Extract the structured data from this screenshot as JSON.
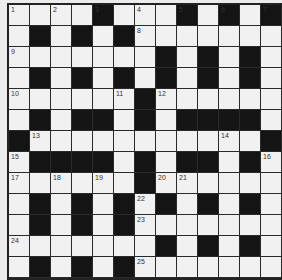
{
  "puzzle": {
    "type": "crossword",
    "rows": 13,
    "cols": 13,
    "colors": {
      "white_cell": "#f1f1f1",
      "black_cell": "#141414",
      "background": "#ececec",
      "grid_line": "#2a2a2a"
    },
    "layout": [
      "....#...#.#.#",
      ".#.#.#.......",
      ".......#.#.#.",
      ".#.#.#.#.#.#.",
      "......#......",
      ".#.##.#.####.",
      "#...........#",
      ".####.#.##.#.",
      "......#......",
      ".#.#.#.#.#.#.",
      ".#.#.#.......",
      ".......#.#.#.",
      ".#.#.#......."
    ],
    "numbers": [
      {
        "row": 0,
        "col": 0,
        "n": "1"
      },
      {
        "row": 0,
        "col": 2,
        "n": "2"
      },
      {
        "row": 0,
        "col": 4,
        "n": "3"
      },
      {
        "row": 0,
        "col": 6,
        "n": "4"
      },
      {
        "row": 0,
        "col": 8,
        "n": "5"
      },
      {
        "row": 0,
        "col": 10,
        "n": "6"
      },
      {
        "row": 0,
        "col": 12,
        "n": "7"
      },
      {
        "row": 1,
        "col": 6,
        "n": "8"
      },
      {
        "row": 2,
        "col": 0,
        "n": "9"
      },
      {
        "row": 4,
        "col": 0,
        "n": "10"
      },
      {
        "row": 4,
        "col": 5,
        "n": "11"
      },
      {
        "row": 4,
        "col": 7,
        "n": "12"
      },
      {
        "row": 6,
        "col": 1,
        "n": "13"
      },
      {
        "row": 6,
        "col": 10,
        "n": "14"
      },
      {
        "row": 7,
        "col": 0,
        "n": "15"
      },
      {
        "row": 7,
        "col": 12,
        "n": "16"
      },
      {
        "row": 8,
        "col": 0,
        "n": "17"
      },
      {
        "row": 8,
        "col": 2,
        "n": "18"
      },
      {
        "row": 8,
        "col": 4,
        "n": "19"
      },
      {
        "row": 8,
        "col": 7,
        "n": "20"
      },
      {
        "row": 8,
        "col": 8,
        "n": "21"
      },
      {
        "row": 9,
        "col": 6,
        "n": "22"
      },
      {
        "row": 10,
        "col": 6,
        "n": "23"
      },
      {
        "row": 11,
        "col": 0,
        "n": "24"
      },
      {
        "row": 12,
        "col": 6,
        "n": "25"
      }
    ]
  }
}
